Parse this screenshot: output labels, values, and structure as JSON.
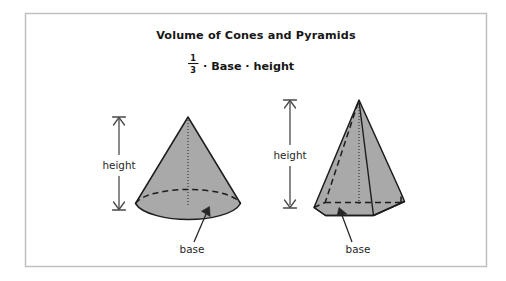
{
  "figure": {
    "title": "Volume of Cones and Pyramids",
    "formula": {
      "fraction_numerator": "1",
      "fraction_denominator": "3",
      "expression": "· Base · height",
      "full_text": "1/3 · Base · height"
    },
    "colors": {
      "frame_border": "#bcbcbc",
      "background": "#ffffff",
      "solid_fill": "#a9a9a9",
      "outline": "#1d1d1d",
      "text": "#161616",
      "dimension_line": "#4a4a4a"
    },
    "shapes": [
      {
        "id": "cone",
        "name": "cone",
        "height_label": "height",
        "base_label": "base"
      },
      {
        "id": "pyramid",
        "name": "pyramid",
        "height_label": "height",
        "base_label": "base"
      }
    ]
  }
}
